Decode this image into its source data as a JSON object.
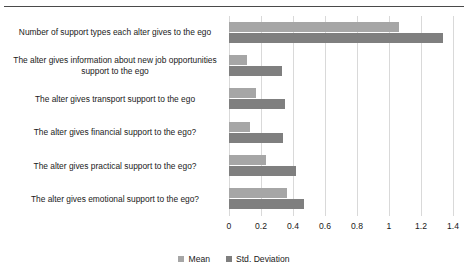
{
  "chart_data": {
    "type": "bar",
    "orientation": "horizontal",
    "title": "",
    "xlabel": "",
    "ylabel": "",
    "xlim": [
      0,
      1.4
    ],
    "xticks": [
      "0",
      "0.2",
      "0.4",
      "0.6",
      "0.8",
      "1",
      "1.2",
      "1.4"
    ],
    "xtick_values": [
      0,
      0.2,
      0.4,
      0.6,
      0.8,
      1,
      1.2,
      1.4
    ],
    "grid": true,
    "legend_position": "bottom",
    "categories": [
      "Number of support types each alter gives to the ego",
      "The alter gives information about new job opportunities support to the ego",
      "The alter gives transport support to the ego",
      "The alter gives financial support to the ego?",
      "The alter gives practical support to the ego?",
      "The alter gives emotional support to the ego?"
    ],
    "series": [
      {
        "name": "Mean",
        "color": "#a6a6a6",
        "values": [
          1.06,
          0.11,
          0.17,
          0.13,
          0.23,
          0.36
        ]
      },
      {
        "name": "Std. Deviation",
        "color": "#7f7f7f",
        "values": [
          1.34,
          0.33,
          0.35,
          0.34,
          0.42,
          0.47
        ]
      }
    ]
  },
  "legend": {
    "items": [
      {
        "label": "Mean",
        "color": "#a6a6a6"
      },
      {
        "label": "Std. Deviation",
        "color": "#7f7f7f"
      }
    ]
  },
  "colors": {
    "mean": "#a6a6a6",
    "std_deviation": "#7f7f7f",
    "gridline": "#d9d9d9",
    "rule": "#4a4a4a",
    "text": "#1a1a1a",
    "background": "#ffffff"
  }
}
